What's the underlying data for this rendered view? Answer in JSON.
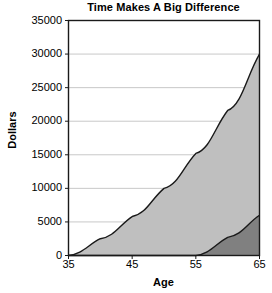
{
  "chart_data": {
    "type": "area",
    "title": "Time Makes A Big Difference",
    "xlabel": "Age",
    "ylabel": "Dollars",
    "xlim": [
      35,
      65
    ],
    "ylim": [
      0,
      35000
    ],
    "xticks": [
      35,
      45,
      55,
      65
    ],
    "yticks": [
      0,
      5000,
      10000,
      15000,
      20000,
      25000,
      30000,
      35000
    ],
    "xtick_labels": [
      "35",
      "45",
      "55",
      "65"
    ],
    "ytick_labels": [
      "0",
      "5000",
      "10000",
      "15000",
      "20000",
      "25000",
      "30000",
      "35000"
    ],
    "grid": "horizontal",
    "legend": "none",
    "x": [
      35,
      40,
      45,
      50,
      55,
      60,
      65
    ],
    "series": [
      {
        "name": "Started at 35",
        "color": "#bfbfbf",
        "line_color": "#1a1a1a",
        "values": [
          0,
          2500,
          5800,
          10000,
          15200,
          21600,
          30000
        ]
      },
      {
        "name": "Started at 55",
        "color": "#808080",
        "line_color": "#1a1a1a",
        "values": [
          0,
          0,
          0,
          0,
          0,
          2700,
          6000
        ]
      }
    ]
  },
  "colors": {
    "axis": "#1a1a1a",
    "grid": "#c8c8c8",
    "background": "#ffffff",
    "series_light": "#bfbfbf",
    "series_dark": "#808080"
  }
}
